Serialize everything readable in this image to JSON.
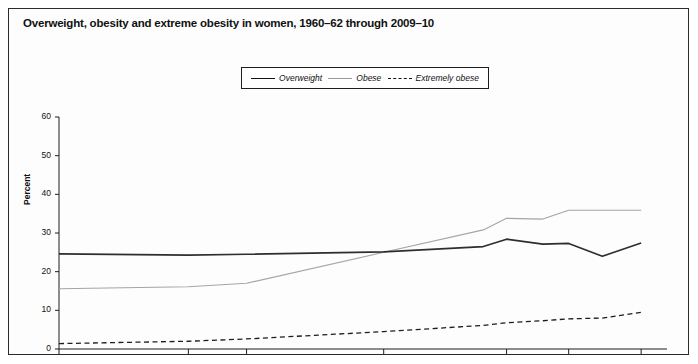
{
  "figure": {
    "title": "Overweight, obesity and extreme obesity in women, 1960–62 through 2009–10"
  },
  "legend": {
    "entries": [
      {
        "label": "Overweight",
        "style": "solid-dark"
      },
      {
        "label": "Obese",
        "style": "thin-gray"
      },
      {
        "label": "Extremely obese",
        "style": "dashed-dark"
      }
    ]
  },
  "axes": {
    "y_title": "Percent",
    "y_ticks": [
      "0",
      "10",
      "20",
      "30",
      "40",
      "50",
      "60"
    ],
    "x_ticks": [
      "1960–1962",
      "1971–1974",
      "1976–1980",
      "1988–1994",
      "2001–2002",
      "2005–2006",
      "2009–2010"
    ]
  },
  "chart_data": {
    "type": "line",
    "title": "Overweight, obesity and extreme obesity in women, 1960–62 through 2009–10",
    "xlabel": "",
    "ylabel": "Percent",
    "ylim": [
      0,
      60
    ],
    "grid": false,
    "legend_position": "top-center",
    "categories": [
      "1960–1962",
      "1971–1974",
      "1976–1980",
      "1988–1994",
      "1999–2000",
      "2001–2002",
      "2003–2004",
      "2005–2006",
      "2007–2008",
      "2009–2010"
    ],
    "x_positions": [
      0,
      50,
      72.5,
      125.5,
      164,
      173,
      187,
      197,
      210,
      225
    ],
    "x_tick_categories": [
      "1960–1962",
      "1971–1974",
      "1976–1980",
      "1988–1994",
      "2001–2002",
      "2005–2006",
      "2009–2010"
    ],
    "series": [
      {
        "name": "Overweight",
        "values": [
          24.6,
          24.3,
          24.5,
          25.1,
          26.5,
          28.4,
          27.1,
          27.3,
          24.0,
          27.4
        ]
      },
      {
        "name": "Obese",
        "values": [
          15.6,
          16.1,
          17.0,
          25.0,
          30.8,
          33.8,
          33.6,
          35.9,
          35.9,
          35.9
        ]
      },
      {
        "name": "Extremely obese",
        "values": [
          1.4,
          2.0,
          2.6,
          4.5,
          6.1,
          6.8,
          7.3,
          7.8,
          8.0,
          9.5
        ]
      }
    ]
  },
  "colors": {
    "overweight": "#2e2e2e",
    "obese": "#a5a5a5",
    "extremely_obese": "#1d1d1d",
    "axis": "#1d1d1d",
    "border": "#2b2b2b"
  }
}
